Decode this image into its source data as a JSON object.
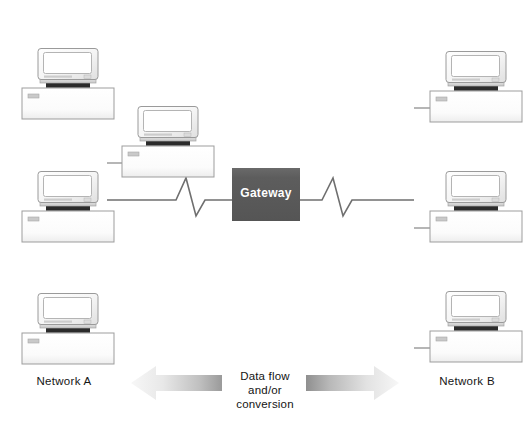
{
  "diagram": {
    "background_color": "#ffffff"
  },
  "networks": {
    "left": {
      "label": "Network A",
      "backbone_color": "#8c8c8c"
    },
    "right": {
      "label": "Network B",
      "backbone_color": "#8c8c8c"
    }
  },
  "gateway": {
    "label": "Gateway",
    "fill_color": "#5c5c5c",
    "text_color": "#ffffff"
  },
  "flow": {
    "line1": "Data flow",
    "line2": "and/or",
    "line3": "conversion",
    "left_arrow_name": "arrow-left",
    "right_arrow_name": "arrow-right",
    "arrow_light_color": "#f2f2f2",
    "arrow_dark_color": "#8a8a8a"
  },
  "nodes": {
    "left": [
      {
        "name": "workstation-a1"
      },
      {
        "name": "workstation-a2"
      },
      {
        "name": "workstation-a3"
      },
      {
        "name": "workstation-a-server"
      }
    ],
    "right": [
      {
        "name": "workstation-b1"
      },
      {
        "name": "workstation-b2"
      },
      {
        "name": "workstation-b3"
      }
    ]
  },
  "connectors": {
    "left_zigzag_name": "zigzag-link-left",
    "right_zigzag_name": "zigzag-link-right",
    "line_color": "#7a7a7a"
  }
}
